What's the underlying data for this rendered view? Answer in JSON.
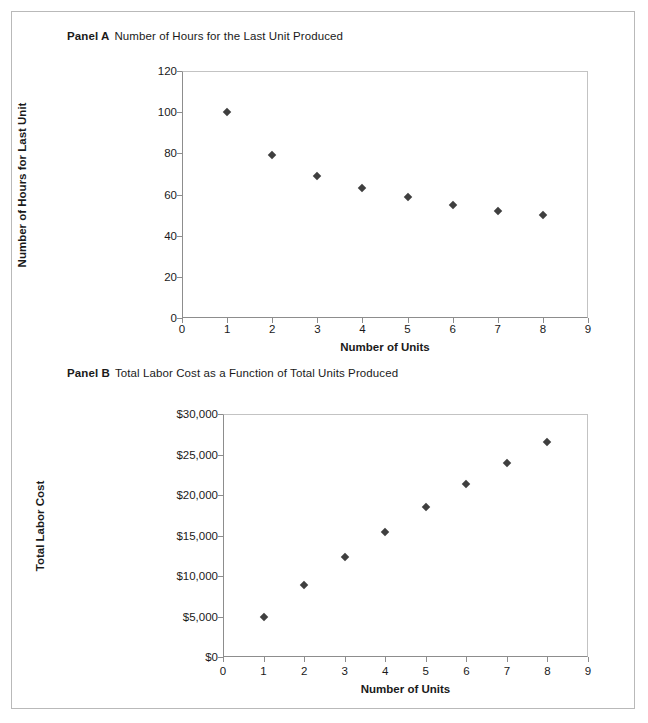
{
  "figure": {
    "panels": [
      {
        "id": "A",
        "label": "Panel A",
        "title": "Number of Hours for the Last Unit Produced"
      },
      {
        "id": "B",
        "label": "Panel B",
        "title": "Total Labor Cost as a Function of Total Units Produced"
      }
    ]
  },
  "chart_data": [
    {
      "type": "scatter",
      "panel": "Panel A",
      "title": "Number of Hours for the Last Unit Produced",
      "xlabel": "Number of Units",
      "ylabel": "Number of Hours for Last Unit",
      "x": [
        1,
        2,
        3,
        4,
        5,
        6,
        7,
        8
      ],
      "values": [
        100,
        79,
        69,
        63,
        59,
        55,
        52,
        50
      ],
      "xlim": [
        0,
        9
      ],
      "ylim": [
        0,
        120
      ],
      "xticks": [
        0,
        1,
        2,
        3,
        4,
        5,
        6,
        7,
        8,
        9
      ],
      "xticklabels": [
        "0",
        "1",
        "2",
        "3",
        "4",
        "5",
        "6",
        "7",
        "8",
        "9"
      ],
      "yticks": [
        0,
        20,
        40,
        60,
        80,
        100,
        120
      ],
      "yticklabels": [
        "0",
        "20",
        "40",
        "60",
        "80",
        "100",
        "120"
      ],
      "grid": false,
      "legend": false,
      "marker": "diamond",
      "marker_color": "#3f3f3f"
    },
    {
      "type": "scatter",
      "panel": "Panel B",
      "title": "Total Labor Cost as a Function of Total Units Produced",
      "xlabel": "Number of Units",
      "ylabel": "Total Labor Cost",
      "x": [
        1,
        2,
        3,
        4,
        5,
        6,
        7,
        8
      ],
      "values": [
        5000,
        8950,
        12400,
        15450,
        18500,
        21300,
        23900,
        26500
      ],
      "xlim": [
        0,
        9
      ],
      "ylim": [
        0,
        30000
      ],
      "xticks": [
        0,
        1,
        2,
        3,
        4,
        5,
        6,
        7,
        8,
        9
      ],
      "xticklabels": [
        "0",
        "1",
        "2",
        "3",
        "4",
        "5",
        "6",
        "7",
        "8",
        "9"
      ],
      "yticks": [
        0,
        5000,
        10000,
        15000,
        20000,
        25000,
        30000
      ],
      "yticklabels": [
        "$0",
        "$5,000",
        "$10,000",
        "$15,000",
        "$20,000",
        "$25,000",
        "$30,000"
      ],
      "grid": false,
      "legend": false,
      "marker": "diamond",
      "marker_color": "#3f3f3f"
    }
  ],
  "colors": {
    "marker": "#3f3f3f",
    "axis": "#8d8d8d",
    "frame": "#b9b9b9",
    "text": "#1a1a1a",
    "background": "#ffffff"
  }
}
